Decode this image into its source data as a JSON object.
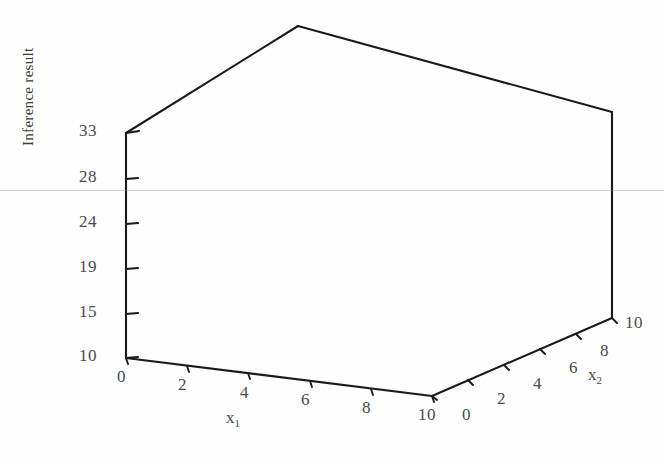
{
  "figure": {
    "background_color": "#fefefe",
    "line_color": "#1a1a1a",
    "text_color": "#4a4a4a",
    "artifact": "faint-horizontal-scanline"
  },
  "axes": {
    "z": {
      "title": "Inference result",
      "ticks": [
        10,
        15,
        19,
        24,
        28,
        33
      ],
      "tick_labels": [
        "10",
        "15",
        "19",
        "24",
        "28",
        "33"
      ],
      "range": [
        10,
        33
      ]
    },
    "x1": {
      "title": "x",
      "subscript": "1",
      "ticks": [
        0,
        2,
        4,
        6,
        8,
        10
      ],
      "tick_labels": [
        "0",
        "2",
        "4",
        "6",
        "8",
        "10"
      ],
      "range": [
        0,
        10
      ]
    },
    "x2": {
      "title": "x",
      "subscript": "2",
      "ticks": [
        0,
        2,
        4,
        6,
        8,
        10
      ],
      "tick_labels": [
        "0",
        "2",
        "4",
        "6",
        "8",
        "10"
      ],
      "range": [
        0,
        10
      ]
    }
  },
  "chart_data": {
    "type": "surface",
    "title": "",
    "xlabel": "x1",
    "ylabel": "x2",
    "zlabel": "Inference result",
    "xlim": [
      0,
      10
    ],
    "ylim": [
      0,
      10
    ],
    "zlim": [
      10,
      33
    ],
    "grid": true,
    "legend": "none",
    "x": [
      0,
      1,
      2,
      3,
      4,
      5,
      6,
      7,
      8,
      9,
      10
    ],
    "y": [
      0,
      1,
      2,
      3,
      4,
      5,
      6,
      7,
      8,
      9,
      10
    ],
    "z": [
      [
        10.0,
        10.6,
        11.6,
        13.0,
        14.6,
        16.4,
        18.2,
        19.9,
        21.3,
        22.4,
        23.0
      ],
      [
        10.6,
        11.3,
        12.4,
        13.8,
        15.5,
        17.3,
        19.1,
        20.8,
        22.2,
        23.3,
        23.9
      ],
      [
        11.6,
        12.4,
        13.5,
        15.0,
        16.7,
        18.6,
        20.4,
        22.1,
        23.5,
        24.6,
        25.2
      ],
      [
        13.0,
        13.8,
        15.0,
        16.6,
        18.4,
        20.3,
        22.2,
        23.9,
        25.3,
        26.4,
        27.0
      ],
      [
        14.6,
        15.5,
        16.7,
        18.4,
        20.2,
        22.2,
        24.1,
        25.8,
        27.2,
        28.3,
        28.9
      ],
      [
        16.4,
        17.3,
        18.6,
        20.3,
        22.2,
        24.2,
        26.1,
        27.8,
        29.2,
        30.3,
        30.9
      ],
      [
        18.2,
        19.1,
        20.4,
        22.2,
        24.1,
        26.1,
        28.0,
        29.7,
        31.1,
        32.2,
        32.8
      ],
      [
        19.9,
        20.8,
        22.1,
        23.9,
        25.8,
        27.8,
        29.7,
        31.4,
        32.8,
        33.0,
        33.0
      ],
      [
        21.3,
        22.2,
        23.5,
        25.3,
        27.2,
        29.2,
        31.1,
        32.8,
        33.0,
        33.0,
        33.0
      ],
      [
        22.4,
        23.3,
        24.6,
        26.4,
        28.3,
        30.3,
        32.2,
        33.0,
        33.0,
        33.0,
        33.0
      ],
      [
        23.0,
        23.9,
        25.2,
        27.0,
        28.9,
        30.9,
        32.8,
        33.0,
        33.0,
        33.0,
        33.0
      ]
    ]
  }
}
